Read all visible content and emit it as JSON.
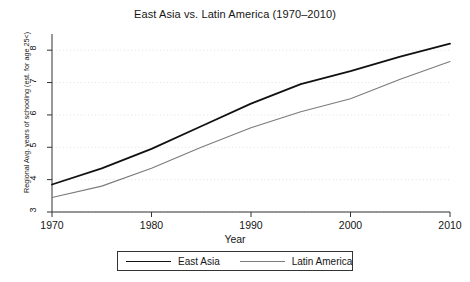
{
  "chart_data": {
    "type": "line",
    "title": "East Asia vs. Latin America (1970–2010)",
    "xlabel": "Year",
    "ylabel": "Regional Avg. years of schooling (est. for age 25<)",
    "xlim": [
      1970,
      2010
    ],
    "ylim": [
      3,
      8.5
    ],
    "xticks": [
      1970,
      1980,
      1990,
      2000,
      2010
    ],
    "yticks": [
      3,
      4,
      5,
      6,
      7,
      8
    ],
    "grid": true,
    "legend_position": "bottom",
    "x": [
      1970,
      1975,
      1980,
      1985,
      1990,
      1995,
      2000,
      2005,
      2010
    ],
    "series": [
      {
        "name": "East Asia",
        "color": "#111111",
        "width": 1.8,
        "values": [
          3.85,
          4.35,
          4.95,
          5.65,
          6.35,
          6.95,
          7.35,
          7.8,
          8.2
        ]
      },
      {
        "name": "Latin America",
        "color": "#7b7b7b",
        "width": 1.1,
        "values": [
          3.45,
          3.8,
          4.35,
          5.0,
          5.6,
          6.1,
          6.5,
          7.1,
          7.65
        ]
      }
    ]
  },
  "legend": {
    "items": [
      {
        "label": "East Asia"
      },
      {
        "label": "Latin America"
      }
    ]
  }
}
